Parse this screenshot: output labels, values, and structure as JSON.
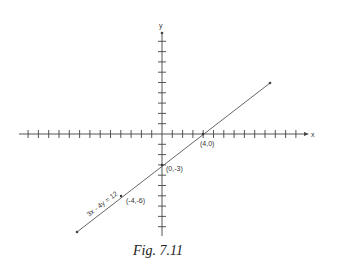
{
  "figure": {
    "caption": "Fig. 7.11",
    "axes": {
      "x_label": "x",
      "y_label": "y"
    },
    "line": {
      "equation_label": "3x - 4y = 12",
      "points": [
        {
          "label": "(4,0)",
          "x": 4,
          "y": 0
        },
        {
          "label": "(0,-3)",
          "x": 0,
          "y": -3
        },
        {
          "label": "(-4,-6)",
          "x": -4,
          "y": -6
        }
      ]
    },
    "colors": {
      "axis": "#444444",
      "line": "#555555",
      "text": "#333333"
    }
  }
}
